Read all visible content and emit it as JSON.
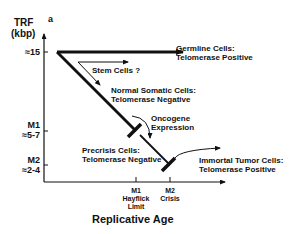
{
  "panel_letter": "a",
  "y_axis": {
    "label_line1": "TRF",
    "label_line2": "(kbp)",
    "ticks": [
      {
        "name": "",
        "value": "≈15"
      },
      {
        "name": "M1",
        "value": "≈5-7"
      },
      {
        "name": "M2",
        "value": "≈2-4"
      }
    ]
  },
  "x_axis": {
    "label": "Replicative Age",
    "ticks": [
      {
        "line1": "M1",
        "line2": "Hayflick",
        "line3": "Limit"
      },
      {
        "line1": "M2",
        "line2": "Crisis",
        "line3": ""
      }
    ]
  },
  "annotations": {
    "germline": {
      "line1": "Germline Cells:",
      "line2": "Telomerase Positive"
    },
    "stem": {
      "line1": "Stem Cells ?"
    },
    "somatic": {
      "line1": "Normal Somatic Cells:",
      "line2": "Telomerase Negative"
    },
    "oncogene": {
      "line1": "Oncogene",
      "line2": "Expression"
    },
    "precrisis": {
      "line1": "Precrisis Cells:",
      "line2": "Telomerase Negative"
    },
    "tumor": {
      "line1": "Immortal Tumor Cells:",
      "line2": "Telomerase Positive"
    }
  }
}
